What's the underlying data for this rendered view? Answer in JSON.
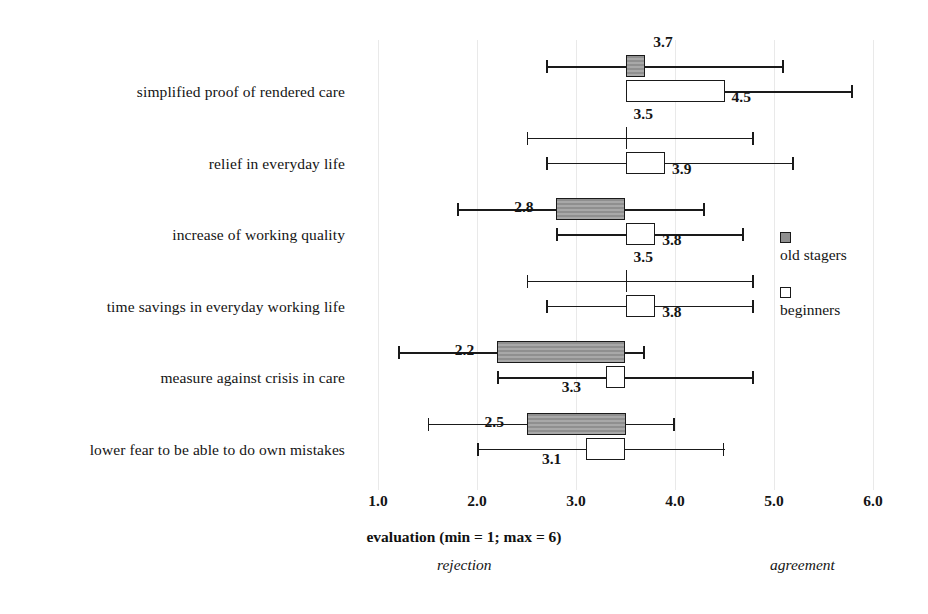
{
  "chart_data": {
    "type": "bar",
    "title": "",
    "xlabel": "evaluation (min = 1; max = 6)",
    "ylabel": "",
    "xlim": [
      1.0,
      6.0
    ],
    "xticks": [
      "1.0",
      "2.0",
      "3.0",
      "4.0",
      "5.0",
      "6.0"
    ],
    "xtick_values": [
      1.0,
      2.0,
      3.0,
      4.0,
      5.0,
      6.0
    ],
    "grid": true,
    "orientation": "horizontal",
    "legend_position": "right",
    "bar_anchor": 3.5,
    "annotations": {
      "left_pole": "rejection",
      "right_pole": "agreement"
    },
    "categories": [
      "simplified proof of rendered care",
      "relief in everyday life",
      "increase of working quality",
      "time savings in everyday working life",
      "measure against crisis in care",
      "lower fear to be able to do own mistakes"
    ],
    "series": [
      {
        "name": "old stagers",
        "style": "filled-gray",
        "values": [
          3.7,
          3.5,
          2.8,
          3.5,
          2.2,
          2.5
        ],
        "value_labels": [
          "3.7",
          "3.5",
          "2.8",
          "3.5",
          "2.2",
          "2.5"
        ],
        "err_low": [
          2.7,
          2.5,
          1.8,
          2.5,
          1.2,
          1.5
        ],
        "err_high": [
          5.1,
          4.8,
          4.3,
          4.8,
          3.7,
          4.0
        ]
      },
      {
        "name": "beginners",
        "style": "hollow-white",
        "values": [
          4.5,
          3.9,
          3.8,
          3.8,
          3.3,
          3.1
        ],
        "value_labels": [
          "4.5",
          "3.9",
          "3.8",
          "3.8",
          "3.3",
          "3.1"
        ],
        "err_low": [
          3.5,
          2.7,
          2.8,
          2.7,
          2.2,
          2.0
        ],
        "err_high": [
          5.8,
          5.2,
          4.7,
          4.8,
          4.8,
          4.5
        ]
      }
    ]
  },
  "legend": {
    "items": [
      {
        "label": "old stagers",
        "swatch": "filled-gray"
      },
      {
        "label": "beginners",
        "swatch": "hollow-white"
      }
    ]
  },
  "axis": {
    "title": "evaluation (min = 1; max = 6)",
    "ticks": [
      "1.0",
      "2.0",
      "3.0",
      "4.0",
      "5.0",
      "6.0"
    ],
    "left_pole": "rejection",
    "right_pole": "agreement"
  },
  "colors": {
    "ink": "#1a1a1a",
    "grid": "#e9e9e9",
    "old_stagers_fill": "#9a9a9a",
    "beginners_fill": "#ffffff",
    "background": "#ffffff"
  }
}
